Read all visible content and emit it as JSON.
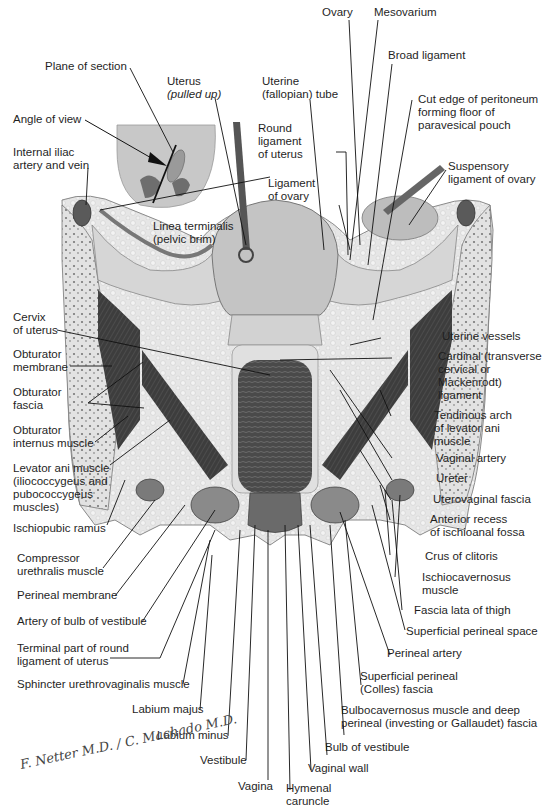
{
  "figure": {
    "inset": {
      "labels": [
        "Plane of section",
        "Angle of view"
      ]
    },
    "labels_top": [
      {
        "id": "plane-of-section",
        "text": "Plane of section"
      },
      {
        "id": "uterus",
        "text": "Uterus",
        "note": "(pulled up)"
      },
      {
        "id": "angle-of-view",
        "text": "Angle of view"
      },
      {
        "id": "internal-iliac",
        "text": "Internal iliac\nartery and vein"
      },
      {
        "id": "uterine-tube",
        "text": "Uterine\n(fallopian) tube"
      },
      {
        "id": "round-ligament",
        "text": "Round\nligament\nof uterus"
      },
      {
        "id": "ligament-of-ovary",
        "text": "Ligament\nof ovary"
      },
      {
        "id": "linea-terminalis",
        "text": "Linea terminalis\n(pelvic brim)"
      },
      {
        "id": "ovary",
        "text": "Ovary"
      },
      {
        "id": "mesovarium",
        "text": "Mesovarium"
      },
      {
        "id": "broad-ligament",
        "text": "Broad ligament"
      },
      {
        "id": "cut-edge-peritoneum",
        "text": "Cut edge of peritoneum\nforming floor of\nparavesical pouch"
      },
      {
        "id": "suspensory-ligament",
        "text": "Suspensory\nligament of ovary"
      }
    ],
    "labels_left": [
      {
        "id": "cervix",
        "text": "Cervix\nof uterus"
      },
      {
        "id": "obturator-membrane",
        "text": "Obturator\nmembrane"
      },
      {
        "id": "obturator-fascia",
        "text": "Obturator\nfascia"
      },
      {
        "id": "obturator-internus",
        "text": "Obturator\ninternus muscle"
      },
      {
        "id": "levator-ani",
        "text": "Levator ani muscle\n(iliococcygeus and\npubococcygeus\nmuscles)"
      },
      {
        "id": "ischiopubic-ramus",
        "text": "Ischiopubic ramus"
      },
      {
        "id": "compressor-urethralis",
        "text": "Compressor\nurethralis muscle"
      },
      {
        "id": "perineal-membrane",
        "text": "Perineal membrane"
      },
      {
        "id": "artery-bulb",
        "text": "Artery of bulb of vestibule"
      },
      {
        "id": "terminal-round-ligament",
        "text": "Terminal part of round\nligament of uterus"
      },
      {
        "id": "sphincter-urethrovaginalis",
        "text": "Sphincter urethrovaginalis muscle"
      },
      {
        "id": "labium-majus",
        "text": "Labium majus"
      },
      {
        "id": "labium-minus",
        "text": "Labium minus"
      },
      {
        "id": "vestibule",
        "text": "Vestibule"
      },
      {
        "id": "vagina",
        "text": "Vagina"
      }
    ],
    "labels_right": [
      {
        "id": "uterine-vessels",
        "text": "Uterine vessels"
      },
      {
        "id": "cardinal-ligament",
        "text": "Cardinal (transverse\ncervical or\nMackenrodt)\nligament"
      },
      {
        "id": "tendinous-arch",
        "text": "Tendinous arch\nof levator ani\nmuscle"
      },
      {
        "id": "vaginal-artery",
        "text": "Vaginal artery"
      },
      {
        "id": "ureter",
        "text": "Ureter"
      },
      {
        "id": "uterovaginal-fascia",
        "text": "Uterovaginal fascia"
      },
      {
        "id": "anterior-recess",
        "text": "Anterior recess\nof ischioanal fossa"
      },
      {
        "id": "crus-clitoris",
        "text": "Crus of clitoris"
      },
      {
        "id": "ischiocavernosus",
        "text": "Ischiocavernosus\nmuscle"
      },
      {
        "id": "fascia-lata",
        "text": "Fascia lata of thigh"
      },
      {
        "id": "superficial-perineal-space",
        "text": "Superficial perineal space"
      },
      {
        "id": "perineal-artery",
        "text": "Perineal artery"
      },
      {
        "id": "colles-fascia",
        "text": "Superficial perineal\n(Colles) fascia"
      },
      {
        "id": "bulbocavernosus",
        "text": "Bulbocavernosus muscle and deep\nperineal (investing or Gallaudet) fascia"
      },
      {
        "id": "bulb-vestibule",
        "text": "Bulb of vestibule"
      },
      {
        "id": "vaginal-wall",
        "text": "Vaginal wall"
      },
      {
        "id": "hymenal-caruncle",
        "text": "Hymenal\ncaruncle"
      }
    ],
    "signature": "F. Netter M.D. / C. Machado M.D."
  }
}
